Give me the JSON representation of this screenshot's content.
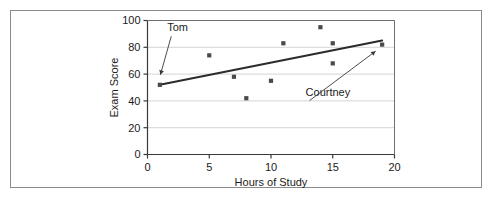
{
  "chart_data": {
    "type": "scatter",
    "title": "",
    "xlabel": "Hours of Study",
    "ylabel": "Exam Score",
    "xlim": [
      0,
      20
    ],
    "ylim": [
      0,
      100
    ],
    "xticks": [
      0,
      5,
      10,
      15,
      20
    ],
    "yticks": [
      0,
      20,
      40,
      60,
      80,
      100
    ],
    "xtick_labels": [
      "0",
      "5",
      "10",
      "15",
      "20"
    ],
    "ytick_labels": [
      "0",
      "20",
      "40",
      "60",
      "80",
      "100"
    ],
    "grid": "horizontal",
    "legend": "none",
    "marker": "square",
    "marker_color": "#4a4a4a",
    "points": [
      {
        "x": 1,
        "y": 52
      },
      {
        "x": 5,
        "y": 74
      },
      {
        "x": 7,
        "y": 58
      },
      {
        "x": 8,
        "y": 42
      },
      {
        "x": 10,
        "y": 55
      },
      {
        "x": 11,
        "y": 83
      },
      {
        "x": 14,
        "y": 95
      },
      {
        "x": 15,
        "y": 83
      },
      {
        "x": 15,
        "y": 68
      },
      {
        "x": 19,
        "y": 82
      }
    ],
    "trendline": {
      "x0": 1,
      "y0": 52,
      "x1": 19,
      "y1": 85,
      "color": "#2b2b2b"
    },
    "annotations": [
      {
        "label": "Tom",
        "label_x": 1.6,
        "label_y": 92,
        "target_x": 1,
        "target_y": 58
      },
      {
        "label": "Courtney",
        "label_x": 12.8,
        "label_y": 44,
        "target_x": 18.6,
        "target_y": 78
      }
    ]
  }
}
